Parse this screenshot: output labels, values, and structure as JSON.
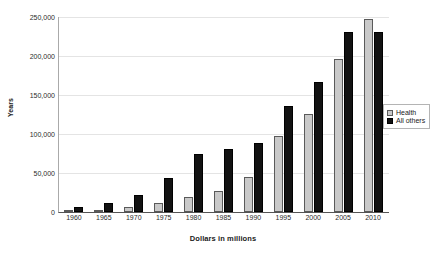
{
  "chart_data": {
    "type": "bar",
    "title": "",
    "subtitle": "",
    "xlabel": "Dollars in millions",
    "ylabel": "Years",
    "categories": [
      "1960",
      "1965",
      "1970",
      "1975",
      "1980",
      "1985",
      "1990",
      "1995",
      "2000",
      "2005",
      "2010"
    ],
    "series": [
      {
        "name": "Health",
        "color": "#c9c9c9",
        "values": [
          2000,
          3000,
          6000,
          11000,
          19000,
          27000,
          45000,
          97000,
          126000,
          196000,
          247000
        ]
      },
      {
        "name": "All others",
        "color": "#121212",
        "values": [
          7000,
          12000,
          22000,
          44000,
          74000,
          81000,
          89000,
          136000,
          167000,
          231000,
          231000
        ]
      }
    ],
    "ylim": [
      0,
      250000
    ],
    "yticks": [
      0,
      50000,
      100000,
      150000,
      200000,
      250000
    ],
    "ytick_labels": [
      "0",
      "50,000",
      "100,000",
      "150,000",
      "200,000",
      "250,000"
    ],
    "grid": true,
    "legend_position": "right",
    "legend_entries": [
      "Health",
      "All others"
    ]
  }
}
